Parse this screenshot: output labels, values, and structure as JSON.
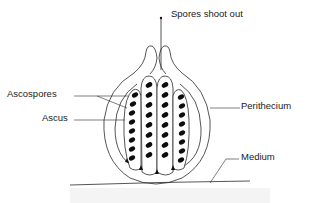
{
  "diagram": {
    "labels": {
      "spores_shoot_out": "Spores shoot out",
      "ascospores": "Ascospores",
      "ascus": "Ascus",
      "perithecium": "Perithecium",
      "medium": "Medium"
    },
    "asci": [
      {
        "name": "ascus-1",
        "spore_count": 8
      },
      {
        "name": "ascus-2",
        "spore_count": 8
      },
      {
        "name": "ascus-3",
        "spore_count": 8
      },
      {
        "name": "ascus-4",
        "spore_count": 8
      }
    ],
    "colors": {
      "line": "#2a2a2a",
      "spore": "#0d0d0d",
      "background": "#ffffff"
    }
  }
}
